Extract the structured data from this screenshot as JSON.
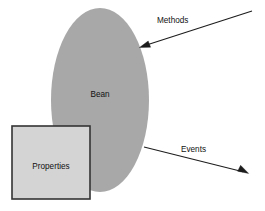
{
  "diagram": {
    "canvas": {
      "width": 265,
      "height": 211,
      "background": "#ffffff"
    },
    "nodes": [
      {
        "id": "bean",
        "label": "Bean",
        "shape": "ellipse",
        "cx": 100,
        "cy": 100,
        "rx": 49,
        "ry": 92,
        "fill": "#a8a8a8",
        "stroke": "none",
        "label_x": 100,
        "label_y": 95
      },
      {
        "id": "properties",
        "label": "Properties",
        "shape": "rect",
        "x": 12,
        "y": 126,
        "width": 78,
        "height": 73,
        "fill": "#d4d4d4",
        "stroke": "#333333",
        "stroke_width": 1.6,
        "label_x": 51,
        "label_y": 167
      }
    ],
    "connectors": [
      {
        "id": "methods-arrow",
        "label": "Methods",
        "direction": "inbound",
        "from_x": 252,
        "from_y": 11,
        "to_x": 140,
        "to_y": 47,
        "label_x": 157,
        "label_y": 21,
        "stroke": "#1c1c1c"
      },
      {
        "id": "events-arrow",
        "label": "Events",
        "direction": "outbound",
        "from_x": 144,
        "from_y": 147,
        "to_x": 248,
        "to_y": 173,
        "label_x": 181,
        "label_y": 150,
        "stroke": "#1c1c1c"
      }
    ],
    "colors": {
      "bean_fill": "#a8a8a8",
      "properties_fill": "#d4d4d4",
      "properties_border": "#333333",
      "arrow": "#1c1c1c",
      "text": "#111111",
      "background": "#ffffff"
    }
  }
}
